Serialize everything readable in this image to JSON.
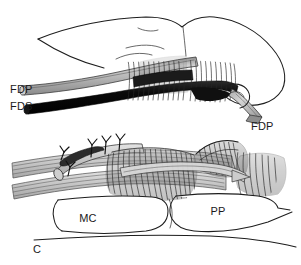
{
  "figure": {
    "panel_letter": "C",
    "background_color": "#ffffff",
    "ink_color": "#1d1d1d",
    "width": 301,
    "height": 265
  },
  "upper_panel": {
    "name": "lateral-view-finger-flexor-tendons",
    "labels": [
      {
        "id": "fdp-proximal",
        "text": "FDP",
        "x": 10,
        "y": 89,
        "anchor": "start"
      },
      {
        "id": "fds-proximal",
        "text": "FDS",
        "x": 10,
        "y": 106,
        "anchor": "start"
      },
      {
        "id": "fdp-distal",
        "text": "FDP",
        "x": 251,
        "y": 126,
        "anchor": "start"
      }
    ],
    "structures": {
      "fdp_tendon_color": "#b3b3b3",
      "fds_tendon_color": "#131313",
      "pulley_fiber_color": "#272727",
      "pulley_count": 2
    }
  },
  "lower_panel": {
    "name": "tendon-repair-detail-view",
    "labels": [
      {
        "id": "metacarpal",
        "text": "MC",
        "x": 88,
        "y": 222,
        "anchor": "middle"
      },
      {
        "id": "proximal-phalanx",
        "text": "PP",
        "x": 218,
        "y": 215,
        "anchor": "middle"
      }
    ],
    "structures": {
      "suture_knot_count": 4,
      "tendon_fiber_color": "#4a4a4a",
      "bone_outline_color": "#1d1d1d"
    }
  }
}
